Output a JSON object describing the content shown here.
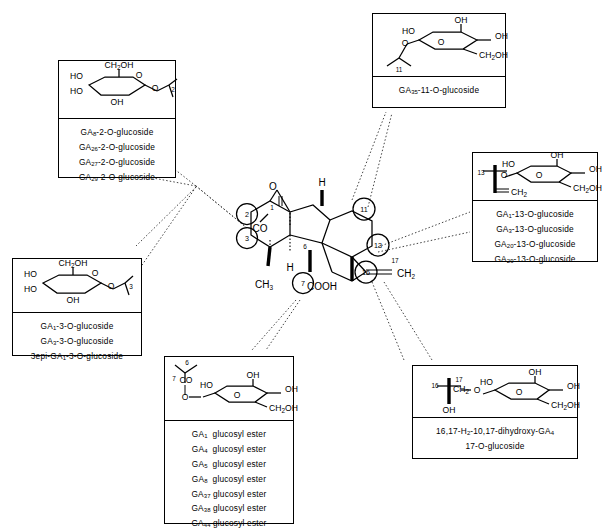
{
  "figure": {
    "type": "chemical-structure-diagram"
  },
  "center": {
    "name": "gibberellane-skeleton",
    "atom_labels": [
      "O",
      "CO",
      "H",
      "H",
      "CH",
      "3",
      "COOH",
      "CH",
      "2",
      "H"
    ],
    "labels": {
      "ketone_o": "O",
      "co": "CO",
      "h_top": "H",
      "h_ring": "H",
      "methyl": "CH₃",
      "carboxyl": "COOH",
      "exo_methylene": "CH₂",
      "c17": "17"
    },
    "circled_positions": [
      "1",
      "2",
      "3",
      "6",
      "7",
      "11",
      "13",
      "16"
    ]
  },
  "panels": [
    {
      "id": "panel-2-o-glucoside",
      "position": "top-left",
      "attachment": "2",
      "sugar": {
        "type": "glucopyranose-haworth",
        "labels": [
          "CH₂OH",
          "HO",
          "HO",
          "OH",
          "O",
          "O"
        ],
        "link_number": "2"
      },
      "items": [
        "GA₈-2-O-glucoside",
        "GA₂₆-2-O-glucoside",
        "GA₂₇-2-O-glucoside",
        "GA₂₉-2-O-glucoside"
      ]
    },
    {
      "id": "panel-11-o-glucoside",
      "position": "top-right",
      "attachment": "11",
      "sugar": {
        "type": "glucopyranose-haworth",
        "labels": [
          "OH",
          "HO",
          "OH",
          "CH₂OH",
          "O",
          "O"
        ],
        "link_number": "11"
      },
      "items": [
        "GA₃₅-11-O-glucoside"
      ]
    },
    {
      "id": "panel-13-o-glucoside",
      "position": "right",
      "attachment": "13",
      "sugar": {
        "type": "glucopyranose-haworth",
        "labels": [
          "OH",
          "HO",
          "OH",
          "CH₂OH",
          "O",
          "O"
        ],
        "link_number": "13",
        "extra_label": "CH₂"
      },
      "items": [
        "GA₁-13-O-glucoside",
        "GA₃-13-O-glucoside",
        "GA₂₀-13-O-glucoside",
        "GA₂₉-13-O-glucoside"
      ]
    },
    {
      "id": "panel-3-o-glucoside",
      "position": "left",
      "attachment": "3",
      "sugar": {
        "type": "glucopyranose-haworth",
        "labels": [
          "CH₂OH",
          "HO",
          "HO",
          "OH",
          "O",
          "O"
        ],
        "link_number": "3"
      },
      "items": [
        "GA₁-3-O-glucoside",
        "GA₃-3-O-glucoside",
        "3epi-GA₁-3-O-glucoside"
      ]
    },
    {
      "id": "panel-glucosyl-ester",
      "position": "bottom-center",
      "attachment": "7",
      "sugar": {
        "type": "glucopyranose-haworth",
        "labels": [
          "OH",
          "HO",
          "OH",
          "CH₂OH",
          "O",
          "O",
          "CO"
        ],
        "link_number": "7",
        "extra_label": "6"
      },
      "items": [
        "GA₁  glucosyl ester",
        "GA₄  glucosyl ester",
        "GA₅  glucosyl ester",
        "GA₈  glucosyl ester",
        "GA₃₇ glucosyl ester",
        "GA₃₈ glucosyl ester",
        "GA₄₄ glucosyl ester"
      ]
    },
    {
      "id": "panel-17-o-glucoside",
      "position": "bottom-right",
      "attachment": "16",
      "sugar": {
        "type": "glucopyranose-haworth",
        "labels": [
          "OH",
          "HO",
          "OH",
          "CH₂OH",
          "O",
          "O",
          "CH₂",
          "OH"
        ],
        "link_number": "17",
        "extra_label": "16"
      },
      "caption_lines": [
        "16,17-H₂-10,17-dihydroxy-GA₄",
        "17-O-glucoside"
      ]
    }
  ],
  "colors": {
    "ink": "#000000",
    "paper": "#ffffff",
    "leader": "#444444"
  }
}
